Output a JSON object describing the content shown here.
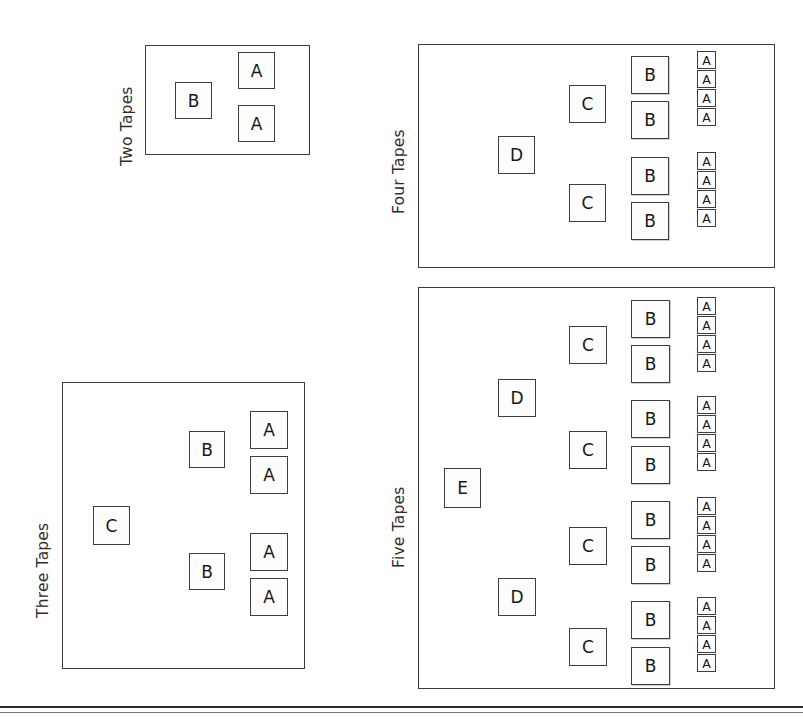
{
  "figure": {
    "kind": "recursive-merge-tape-diagram",
    "node_labels": {
      "a": "A",
      "b": "B",
      "c": "C",
      "d": "D",
      "e": "E"
    },
    "colors": {
      "ink": "#3b3b3b",
      "text": "#171717",
      "paper": "#ffffff",
      "caption": "#2d2d2d"
    }
  },
  "panels": [
    {
      "id": "two-tapes",
      "caption": "Two Tapes",
      "rect": {
        "x": 145,
        "y": 45,
        "w": 165,
        "h": 110
      },
      "caption_pos": {
        "x": 136,
        "y": 148
      },
      "node_size": 35,
      "small_node_size": 14,
      "levels": [
        "B",
        "A"
      ],
      "counts": {
        "A": 2,
        "B": 1
      },
      "nodes": [
        {
          "label": "B",
          "x": 175,
          "y": 82,
          "w": 37,
          "h": 37,
          "cls": ""
        },
        {
          "label": "A",
          "x": 238,
          "y": 52,
          "w": 37,
          "h": 37,
          "cls": ""
        },
        {
          "label": "A",
          "x": 238,
          "y": 105,
          "w": 37,
          "h": 37,
          "cls": ""
        }
      ]
    },
    {
      "id": "three-tapes",
      "caption": "Three Tapes",
      "rect": {
        "x": 62,
        "y": 382,
        "w": 243,
        "h": 287
      },
      "caption_pos": {
        "x": 52,
        "y": 600
      },
      "node_size": 35,
      "levels": [
        "C",
        "B",
        "A"
      ],
      "counts": {
        "A": 4,
        "B": 2,
        "C": 1
      },
      "nodes": [
        {
          "label": "C",
          "x": 93,
          "y": 506,
          "w": 37,
          "h": 39,
          "cls": ""
        },
        {
          "label": "B",
          "x": 189,
          "y": 431,
          "w": 36,
          "h": 37,
          "cls": ""
        },
        {
          "label": "A",
          "x": 250,
          "y": 411,
          "w": 38,
          "h": 38,
          "cls": ""
        },
        {
          "label": "A",
          "x": 250,
          "y": 456,
          "w": 38,
          "h": 38,
          "cls": ""
        },
        {
          "label": "B",
          "x": 189,
          "y": 553,
          "w": 36,
          "h": 37,
          "cls": ""
        },
        {
          "label": "A",
          "x": 250,
          "y": 533,
          "w": 38,
          "h": 38,
          "cls": ""
        },
        {
          "label": "A",
          "x": 250,
          "y": 578,
          "w": 38,
          "h": 38,
          "cls": ""
        }
      ]
    },
    {
      "id": "four-tapes",
      "caption": "Four Tapes",
      "rect": {
        "x": 418,
        "y": 44,
        "w": 357,
        "h": 224
      },
      "caption_pos": {
        "x": 408,
        "y": 196
      },
      "node_size": 35,
      "levels": [
        "D",
        "C",
        "B",
        "A"
      ],
      "counts": {
        "A": 8,
        "B": 4,
        "C": 2,
        "D": 1
      },
      "nodes": [
        {
          "label": "D",
          "x": 498,
          "y": 136,
          "w": 37,
          "h": 38,
          "cls": ""
        },
        {
          "label": "C",
          "x": 569,
          "y": 85,
          "w": 37,
          "h": 38,
          "cls": ""
        },
        {
          "label": "B",
          "x": 631,
          "y": 56,
          "w": 38,
          "h": 38,
          "cls": "shadow"
        },
        {
          "label": "B",
          "x": 631,
          "y": 101,
          "w": 38,
          "h": 38,
          "cls": "shadow"
        },
        {
          "label": "C",
          "x": 569,
          "y": 184,
          "w": 37,
          "h": 38,
          "cls": ""
        },
        {
          "label": "B",
          "x": 631,
          "y": 157,
          "w": 38,
          "h": 38,
          "cls": "shadow"
        },
        {
          "label": "B",
          "x": 631,
          "y": 202,
          "w": 38,
          "h": 38,
          "cls": "shadow"
        }
      ],
      "small_groups": [
        {
          "x": 697,
          "y": 51,
          "count": 4,
          "w": 19,
          "h": 18,
          "gap": 1
        },
        {
          "x": 697,
          "y": 152,
          "count": 4,
          "w": 19,
          "h": 18,
          "gap": 1
        }
      ]
    },
    {
      "id": "five-tapes",
      "caption": "Five Tapes",
      "rect": {
        "x": 418,
        "y": 287,
        "w": 357,
        "h": 402
      },
      "caption_pos": {
        "x": 408,
        "y": 550
      },
      "node_size": 35,
      "levels": [
        "E",
        "D",
        "C",
        "B",
        "A"
      ],
      "counts": {
        "A": 16,
        "B": 8,
        "C": 4,
        "D": 2,
        "E": 1
      },
      "nodes": [
        {
          "label": "E",
          "x": 444,
          "y": 468,
          "w": 37,
          "h": 40,
          "cls": ""
        },
        {
          "label": "D",
          "x": 498,
          "y": 379,
          "w": 38,
          "h": 38,
          "cls": ""
        },
        {
          "label": "C",
          "x": 569,
          "y": 326,
          "w": 38,
          "h": 38,
          "cls": ""
        },
        {
          "label": "B",
          "x": 631,
          "y": 300,
          "w": 39,
          "h": 38,
          "cls": "shadow"
        },
        {
          "label": "B",
          "x": 631,
          "y": 345,
          "w": 39,
          "h": 38,
          "cls": "shadow"
        },
        {
          "label": "C",
          "x": 569,
          "y": 431,
          "w": 38,
          "h": 38,
          "cls": ""
        },
        {
          "label": "B",
          "x": 631,
          "y": 400,
          "w": 39,
          "h": 38,
          "cls": "shadow"
        },
        {
          "label": "B",
          "x": 631,
          "y": 446,
          "w": 39,
          "h": 38,
          "cls": "shadow"
        },
        {
          "label": "D",
          "x": 498,
          "y": 578,
          "w": 38,
          "h": 38,
          "cls": ""
        },
        {
          "label": "C",
          "x": 569,
          "y": 527,
          "w": 38,
          "h": 38,
          "cls": ""
        },
        {
          "label": "B",
          "x": 631,
          "y": 501,
          "w": 39,
          "h": 38,
          "cls": "shadow"
        },
        {
          "label": "B",
          "x": 631,
          "y": 546,
          "w": 39,
          "h": 38,
          "cls": "shadow"
        },
        {
          "label": "C",
          "x": 569,
          "y": 628,
          "w": 38,
          "h": 38,
          "cls": ""
        },
        {
          "label": "B",
          "x": 631,
          "y": 601,
          "w": 39,
          "h": 38,
          "cls": "shadow"
        },
        {
          "label": "B",
          "x": 631,
          "y": 647,
          "w": 39,
          "h": 38,
          "cls": "shadow"
        }
      ],
      "small_groups": [
        {
          "x": 697,
          "y": 297,
          "count": 4,
          "w": 19,
          "h": 18,
          "gap": 1
        },
        {
          "x": 697,
          "y": 396,
          "count": 4,
          "w": 19,
          "h": 18,
          "gap": 1
        },
        {
          "x": 697,
          "y": 497,
          "count": 4,
          "w": 19,
          "h": 18,
          "gap": 1
        },
        {
          "x": 697,
          "y": 597,
          "count": 4,
          "w": 19,
          "h": 18,
          "gap": 1
        }
      ]
    }
  ],
  "page_rules": [
    {
      "y": 706,
      "style": "thick"
    },
    {
      "y": 712,
      "style": "thin"
    }
  ]
}
